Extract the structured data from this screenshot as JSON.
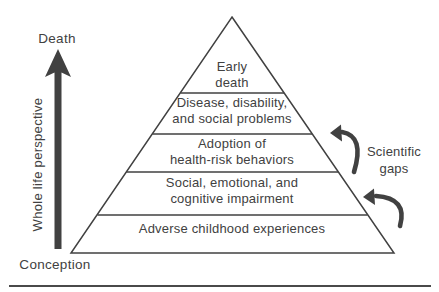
{
  "figure": {
    "left_axis": {
      "top_label": "Death",
      "bottom_label": "Conception",
      "axis_label": "Whole life perspective"
    },
    "pyramid": {
      "levels": [
        {
          "lines": [
            "Early",
            "death"
          ]
        },
        {
          "lines": [
            "Disease, disability,",
            "and social problems"
          ]
        },
        {
          "lines": [
            "Adoption of",
            "health-risk behaviors"
          ]
        },
        {
          "lines": [
            "Social, emotional, and",
            "cognitive impairment"
          ]
        },
        {
          "lines": [
            "Adverse childhood experiences"
          ]
        }
      ]
    },
    "annotations": {
      "scientific_gaps": {
        "lines": [
          "Scientific",
          "gaps"
        ]
      }
    },
    "icons": {
      "life_arrow": "up-arrow",
      "gap_arrow_top": "curved-left-arrow",
      "gap_arrow_bottom": "curved-left-arrow"
    },
    "colors": {
      "ink": "#414141",
      "background": "#ffffff"
    }
  }
}
